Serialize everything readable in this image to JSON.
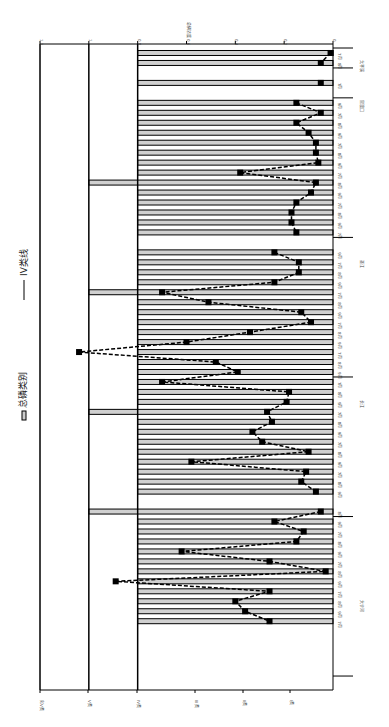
{
  "chart_data": {
    "type": "bar",
    "orientation": "rotated-90-clockwise",
    "title": "",
    "value_axis_label": "总磷浓度",
    "value_axis_ticks": [
      0,
      0.2,
      0.4,
      0.6,
      0.8,
      1,
      1.2
    ],
    "ylim": [
      0,
      1.2
    ],
    "category_level_labels": [
      "I类",
      "II类",
      "III类",
      "IV类",
      "V类",
      "劣V类"
    ],
    "category_level_values": [
      0.02,
      0.1,
      0.2,
      0.3,
      0.4,
      0.5
    ],
    "legend": [
      {
        "name": "总磷类别",
        "type": "bar"
      },
      {
        "name": "IV类线",
        "type": "line"
      }
    ],
    "series": [
      {
        "name": "总磷类别",
        "type": "bar",
        "values": [
          0.8,
          0.8,
          0.8,
          0.8,
          0.8,
          0.8,
          0.8,
          0.8,
          0.8,
          0.8,
          0.8,
          0.8,
          0.8,
          1.0,
          0.8,
          0.8,
          0.8,
          0.8,
          0.8,
          0.8,
          0.8,
          0.8,
          0.8,
          0.8,
          1.0,
          0.8,
          0.8,
          0.8,
          0.8,
          0.8,
          0.8,
          0.8,
          0.8,
          0.8,
          0.8,
          0.8,
          1.0,
          0.8,
          0.8,
          0.8,
          0.8,
          0.8,
          0.8,
          0.8,
          0.8,
          0.8,
          1.0,
          0.8,
          0.8,
          0.8,
          0.8,
          0.8,
          0.8,
          0.8,
          0.8,
          0.8,
          0.8,
          0.8,
          0.8,
          1.0,
          0.8,
          0.8,
          0.8,
          0.8
        ]
      },
      {
        "name": "总磷浓度",
        "type": "line",
        "values": [
          0.01,
          0.05,
          null,
          0.05,
          null,
          0.15,
          0.05,
          0.15,
          0.1,
          0.07,
          0.07,
          0.06,
          0.38,
          0.07,
          0.09,
          0.15,
          0.17,
          0.17,
          0.15,
          null,
          0.24,
          0.14,
          0.14,
          0.24,
          0.7,
          0.51,
          0.13,
          0.09,
          0.34,
          0.6,
          1.04,
          0.48,
          0.39,
          0.7,
          0.18,
          0.19,
          0.27,
          0.25,
          0.33,
          0.29,
          0.1,
          0.58,
          0.11,
          0.13,
          0.07,
          null,
          0.05,
          0.24,
          0.12,
          0.15,
          0.62,
          0.26,
          0.03,
          0.89,
          0.26,
          0.4,
          0.36,
          0.26,
          null,
          null,
          null,
          null,
          null,
          null
        ]
      }
    ],
    "annotations": [
      "0.01",
      "0.05",
      "0.05",
      "0.05",
      "0.4",
      "1.04",
      "0.89",
      "0.07",
      "0.05"
    ],
    "groups": [
      {
        "station": "太平溪",
        "periods": [
          "2011年 7月",
          "2012年 7月"
        ]
      },
      {
        "station": "官渡口",
        "periods": [
          "2011年 7月"
        ]
      },
      {
        "station": "巫江",
        "periods": [
          "2011年",
          "2012年",
          "2013年",
          "2014年"
        ]
      },
      {
        "station": "长江",
        "periods": [
          "2011年",
          "2012年",
          "2013年",
          "2014年"
        ]
      },
      {
        "station": "大宁河",
        "periods": [
          "2011年",
          "2012年",
          "2013年",
          "2014年"
        ]
      }
    ],
    "month_labels": [
      "7月",
      "8月",
      "9月"
    ],
    "grid": false,
    "legend_position": "left"
  },
  "legend": {
    "bar_label": "总磷类别",
    "line_label": "IV类线"
  },
  "axis": {
    "title": "总磷浓度",
    "ticks": [
      "0",
      "0.2",
      "0.4",
      "0.6",
      "0.8",
      "1",
      "1.2"
    ]
  },
  "levels": [
    "I类",
    "II类",
    "III类",
    "IV类",
    "V类",
    "劣V类"
  ]
}
